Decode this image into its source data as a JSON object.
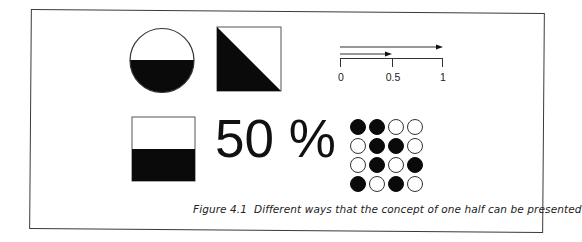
{
  "figure": {
    "caption": "Figure 4.1  Different ways that the concept of one half can be presented",
    "colors": {
      "fill": "#0a0a0a",
      "background": "#ffffff",
      "stroke": "#333333"
    }
  },
  "representations": {
    "half_circle": {
      "shape": "circle",
      "filled_portion": "bottom half"
    },
    "half_square": {
      "shape": "square",
      "filled_portion": "lower-left triangle"
    },
    "number_line": {
      "ticks": [
        {
          "label": "0",
          "value": 0
        },
        {
          "label": "0.5",
          "value": 0.5
        },
        {
          "label": "1",
          "value": 1
        }
      ],
      "arrows": [
        {
          "from": 0,
          "to": 1
        },
        {
          "from": 0,
          "to": 0.5
        }
      ]
    },
    "half_rectangle": {
      "shape": "rectangle",
      "filled_portion": "bottom half"
    },
    "percent": {
      "text": "50 %"
    },
    "dot_grid": {
      "rows": [
        [
          1,
          1,
          0,
          0
        ],
        [
          0,
          1,
          1,
          0
        ],
        [
          0,
          1,
          0,
          1
        ],
        [
          1,
          0,
          1,
          0
        ]
      ],
      "filled_count": 8,
      "total_count": 16
    }
  }
}
